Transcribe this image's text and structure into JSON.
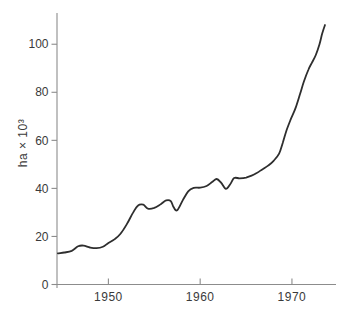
{
  "figure": {
    "ylabel": "ha × 10³"
  },
  "chart_data": {
    "type": "line",
    "title": "",
    "xlabel": "",
    "ylabel": "ha × 10³",
    "x_ticks": [
      1950,
      1960,
      1970
    ],
    "y_ticks": [
      0,
      20,
      40,
      60,
      80,
      100
    ],
    "xlim": [
      1944.4,
      1974.8
    ],
    "ylim": [
      0,
      113
    ],
    "grid": false,
    "legend": false,
    "series": [
      {
        "name": "area-curve",
        "x": [
          1944.5,
          1945.2,
          1946.0,
          1946.7,
          1947.3,
          1948.0,
          1948.7,
          1949.4,
          1950.0,
          1950.7,
          1951.3,
          1952.0,
          1952.7,
          1953.2,
          1953.8,
          1954.3,
          1955.0,
          1955.7,
          1956.3,
          1956.8,
          1957.1,
          1957.5,
          1958.1,
          1958.7,
          1959.3,
          1960.0,
          1960.7,
          1961.3,
          1961.8,
          1962.3,
          1962.8,
          1963.3,
          1963.7,
          1964.3,
          1965.0,
          1965.6,
          1966.2,
          1966.8,
          1967.4,
          1968.0,
          1968.6,
          1969.0,
          1969.4,
          1969.9,
          1970.4,
          1970.9,
          1971.3,
          1971.8,
          1972.2,
          1972.6,
          1973.0,
          1973.3,
          1973.6
        ],
        "y": [
          13.0,
          13.3,
          14.0,
          15.9,
          16.2,
          15.4,
          15.1,
          15.7,
          17.3,
          18.9,
          21.0,
          25.0,
          30.0,
          32.8,
          33.2,
          31.6,
          31.9,
          33.4,
          35.0,
          34.7,
          32.2,
          30.9,
          35.0,
          38.8,
          40.2,
          40.3,
          41.0,
          42.6,
          43.9,
          42.3,
          39.8,
          41.9,
          44.3,
          44.2,
          44.5,
          45.3,
          46.5,
          48.0,
          49.5,
          51.5,
          54.5,
          59.0,
          64.0,
          69.0,
          73.5,
          79.5,
          84.5,
          89.5,
          92.5,
          95.5,
          100.0,
          104.5,
          108.0
        ]
      }
    ],
    "colors": {
      "line": "#2e2e2e",
      "axis": "#8c8c8c",
      "text": "#3a3a3a",
      "background": "#ffffff"
    }
  }
}
